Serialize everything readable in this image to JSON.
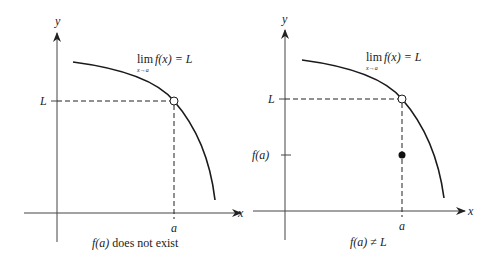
{
  "left_panel": {
    "y_axis_label": "y",
    "x_axis_label": "x",
    "limit_lim": "lim",
    "limit_sub": "x→a",
    "limit_expr": "f(x) = L",
    "L_label": "L",
    "a_label": "a",
    "caption_fa": "f(a)",
    "caption_rest": " does not exist"
  },
  "right_panel": {
    "y_axis_label": "y",
    "x_axis_label": "x",
    "limit_lim": "lim",
    "limit_sub": "x→a",
    "limit_expr": "f(x) = L",
    "L_label": "L",
    "fa_label": "f(a)",
    "a_label": "a",
    "caption": "f(a) ≠ L"
  },
  "colors": {
    "line": "#1a1a1a",
    "axis": "#444444"
  }
}
